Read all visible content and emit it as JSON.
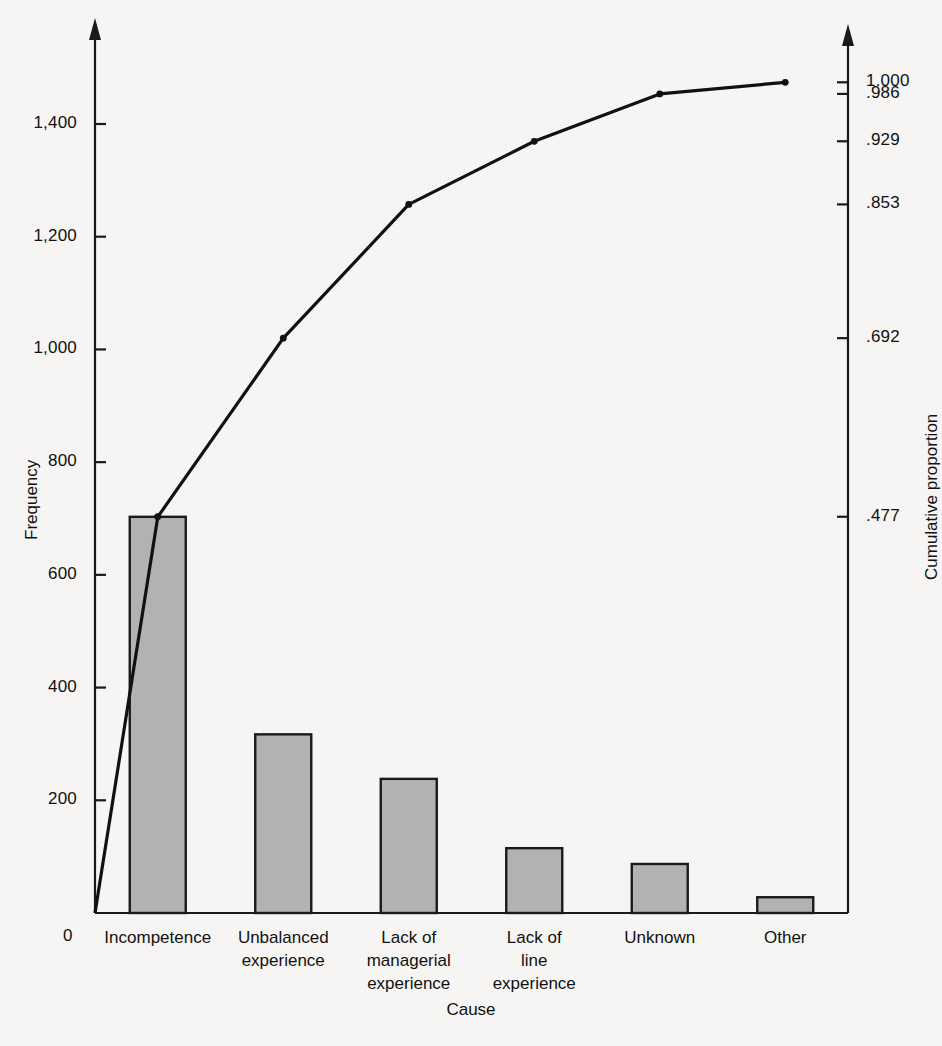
{
  "chart_data": {
    "type": "bar",
    "title": "",
    "subtitle": "",
    "xlabel": "Cause",
    "ylabel": "Frequency",
    "y2label": "Cumulative proportion",
    "categories": [
      "Incompetence",
      "Unbalanced\nexperience",
      "Lack of\nmanagerial\nexperience",
      "Lack of\nline\nexperience",
      "Unknown",
      "Other"
    ],
    "values": [
      703,
      317,
      238,
      115,
      87,
      28
    ],
    "series": [
      {
        "name": "Frequency",
        "type": "bar",
        "values": [
          703,
          317,
          238,
          115,
          87,
          28
        ]
      },
      {
        "name": "Cumulative proportion",
        "type": "line",
        "values": [
          0.477,
          0.692,
          0.853,
          0.929,
          0.986,
          1.0
        ]
      }
    ],
    "ylim": [
      0,
      1474
    ],
    "y2lim": [
      0,
      1.0
    ],
    "yticks": [
      0,
      200,
      400,
      600,
      800,
      1000,
      1200,
      1400
    ],
    "ytick_labels": [
      "0",
      "200",
      "400",
      "600",
      "800",
      "1,000",
      "1,200",
      "1,400"
    ],
    "y2ticks": [
      0.477,
      0.692,
      0.853,
      0.929,
      0.986,
      1.0
    ],
    "y2tick_labels": [
      ".477",
      ".692",
      ".853",
      ".929",
      ".986",
      "1.000"
    ],
    "grid": false,
    "legend": "none",
    "total": 1488
  },
  "style": {
    "background": "#f6f5f3",
    "axis_color": "#1a1a1a",
    "bar_fill": "#b2b2b2",
    "bar_stroke": "#1a1a1a",
    "line_color": "#111111",
    "text_color": "#111111"
  },
  "axes": {
    "left_title": "Frequency",
    "right_title": "Cumulative proportion",
    "bottom_title": "Cause",
    "origin_label": "0"
  }
}
